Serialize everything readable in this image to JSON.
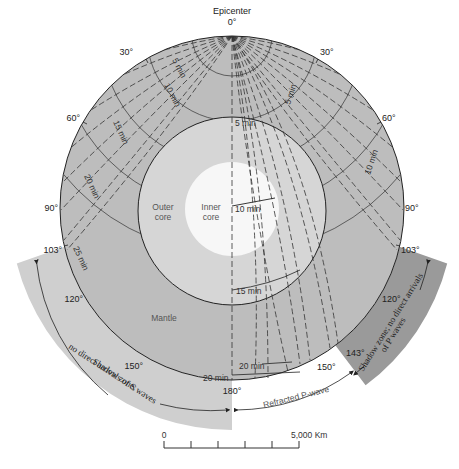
{
  "title": "Epicenter",
  "epicenter_degree": "0°",
  "layers": {
    "mantle": "Mantle",
    "outer_core": [
      "Outer",
      "core"
    ],
    "inner_core": [
      "Inner",
      "core"
    ]
  },
  "degree_labels": {
    "left": [
      "30°",
      "60°",
      "90°",
      "103°",
      "120°",
      "150°",
      "180°"
    ],
    "right": [
      "30°",
      "60°",
      "90°",
      "103°",
      "120°",
      "143°",
      "150°"
    ]
  },
  "time_labels": {
    "mantle_left": [
      "5 min",
      "10 min",
      "15 min",
      "20 min",
      "25 min"
    ],
    "mantle_right": [
      "5 min",
      "10 min"
    ],
    "core": [
      "5 min",
      "10 min",
      "15 min"
    ],
    "bottom": [
      "20 min",
      "20 min"
    ]
  },
  "zones": {
    "s_shadow": [
      "Shadow zone;",
      "no direct arrivals of S waves"
    ],
    "p_shadow": [
      "Shadow zone; no direct arrivals",
      "of P waves"
    ],
    "refracted": "Refracted P-wave"
  },
  "scale": {
    "start": "0",
    "end": "5,000 Km",
    "ticks": 5
  },
  "colors": {
    "mantle": "#bdbdbd",
    "outer_core": "#d6d6d6",
    "inner_core": "#f7f7f7",
    "s_shadow": "#cfcfcf",
    "p_shadow": "#9a9a9a",
    "line": "#333333"
  }
}
